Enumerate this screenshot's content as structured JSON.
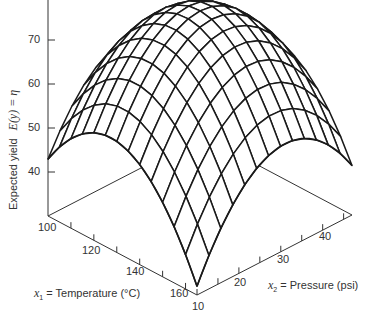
{
  "chart_data": {
    "type": "surface",
    "title": "",
    "zlabel": "Expected yield",
    "zlabel_math": "E(y) = η",
    "x1label_var": "x",
    "x1label_sub": "1",
    "x1label_text": "= Temperature (°C)",
    "x2label_var": "x",
    "x2label_sub": "2",
    "x2label_text": "= Pressure (psi)",
    "z_ticks": [
      "70",
      "60",
      "50",
      "40"
    ],
    "x1_ticks": [
      "100",
      "120",
      "140",
      "160"
    ],
    "x2_ticks": [
      "10",
      "20",
      "30",
      "40"
    ],
    "x1_range": [
      100,
      165
    ],
    "x2_range": [
      10,
      47
    ],
    "z_range": [
      30,
      80
    ],
    "grid": "wireframe mesh 13x13",
    "surface_corners": {
      "x1_100_x2_10": 45,
      "x1_165_x2_10": 35,
      "x1_100_x2_47": 53,
      "x1_165_x2_47": 60
    },
    "peak_approx": {
      "x1": 135,
      "x2": 30,
      "z": 75
    },
    "line_color": "#1a1a1a",
    "axis_color": "#333333"
  }
}
